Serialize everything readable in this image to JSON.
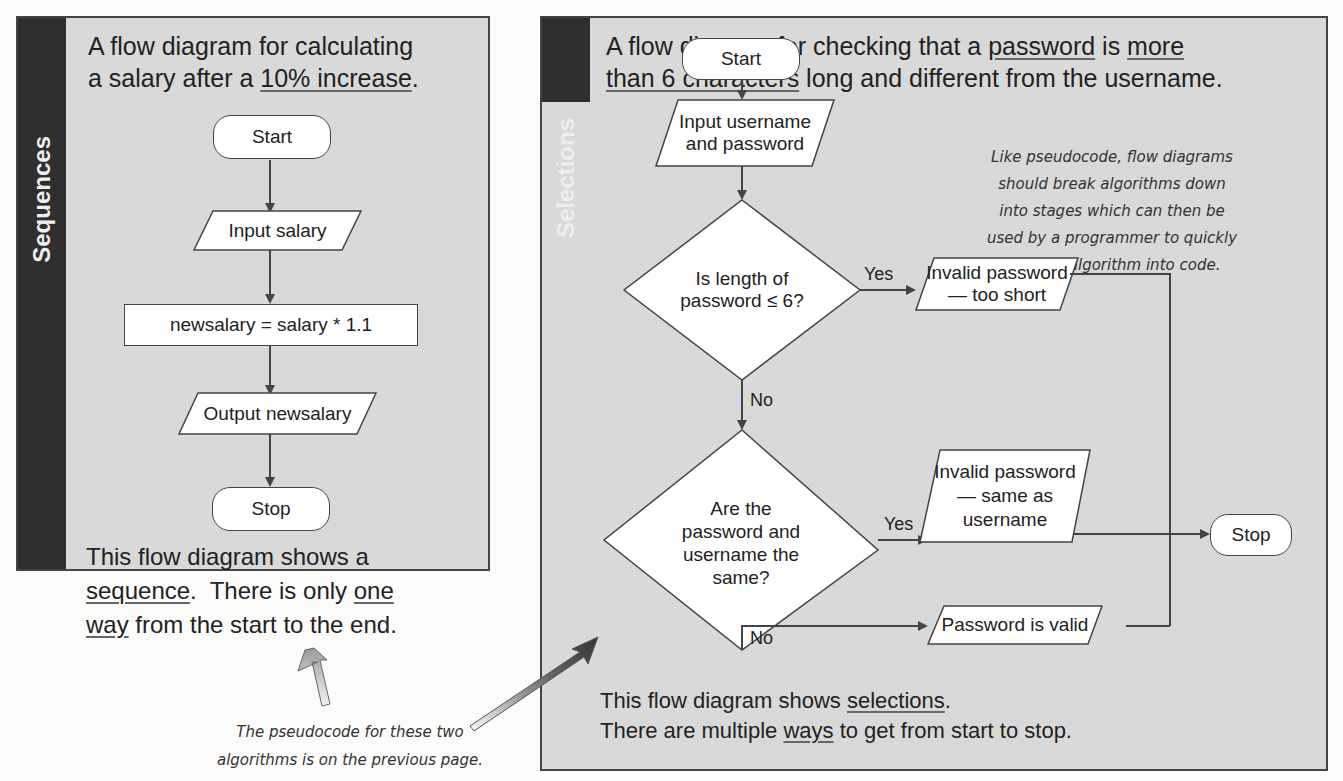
{
  "sequences": {
    "tab_label": "Sequences",
    "heading_line1": "A flow diagram for calculating",
    "heading_line2_pre": "a salary after a ",
    "heading_line2_u": "10% increase",
    "heading_line2_post": ".",
    "nodes": {
      "start": "Start",
      "input": "Input salary",
      "process": "newsalary = salary * 1.1",
      "output": "Output newsalary",
      "stop": "Stop"
    },
    "footer_line1": "This flow diagram shows a",
    "footer_line2_u1": "sequence",
    "footer_line2_mid": ".  There is only ",
    "footer_line2_u2": "one",
    "footer_line3_u": "way",
    "footer_line3_post": " from the start to the end."
  },
  "selections": {
    "tab_label": "Selections",
    "heading_l1_pre": "A flow diagram for checking that a ",
    "heading_l1_u1": "password",
    "heading_l1_mid": " is ",
    "heading_l1_u2": "more",
    "heading_l2_u": "than 6 characters",
    "heading_l2_post": " long and different from the username.",
    "nodes": {
      "start": "Start",
      "input_l1": "Input username",
      "input_l2": "and password",
      "decision1_l1": "Is length of",
      "decision1_l2": "password ≤ 6?",
      "out_short_l1": "Invalid password",
      "out_short_l2": "— too short",
      "decision2_l1": "Are the",
      "decision2_l2": "password and",
      "decision2_l3": "username the",
      "decision2_l4": "same?",
      "out_same_l1": "Invalid password",
      "out_same_l2": "— same as",
      "out_same_l3": "username",
      "out_valid": "Password is valid",
      "stop": "Stop"
    },
    "edge_labels": {
      "d1_yes": "Yes",
      "d1_no": "No",
      "d2_yes": "Yes",
      "d2_no": "No"
    },
    "callout_lines": [
      "Like pseudocode, flow diagrams",
      "should break algorithms down",
      "into stages which can then be",
      "used by a programmer to quickly",
      "turn the algorithm into code."
    ],
    "footer_l1_pre": "This flow diagram shows ",
    "footer_l1_u": "selections",
    "footer_l1_post": ".",
    "footer_l2_pre": "There are multiple ",
    "footer_l2_u": "ways",
    "footer_l2_post": " to get from start to stop."
  },
  "bottom_note": {
    "line1": "The pseudocode for these two",
    "line2": "algorithms is on the previous page."
  },
  "colors": {
    "panel_bg": "#d9d9d9",
    "tab_bg": "#2f2f2f",
    "border": "#444444",
    "shape_fill": "#ffffff"
  }
}
